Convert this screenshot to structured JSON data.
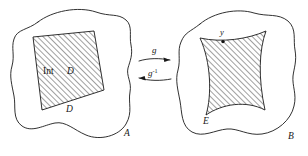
{
  "figure": {
    "background_color": "#ffffff",
    "ink_color": "#1a1a1a",
    "width": 308,
    "height": 156
  },
  "left_panel": {
    "set_label": "A",
    "region_interior_label_prefix": "Int",
    "region_interior_label_name": "D",
    "region_boundary_label": "D",
    "hatch_angle_degrees": 45,
    "region_type": "straight-sided quadrilateral"
  },
  "right_panel": {
    "set_label": "B",
    "region_label": "E",
    "point_label": "y",
    "hatch_angle_degrees": 45,
    "region_type": "curvilinear quadrilateral with concave sides"
  },
  "maps": {
    "forward": {
      "label": "g",
      "direction": "left-to-right"
    },
    "inverse": {
      "label_base": "g",
      "label_exponent": "-1",
      "label_full": "g⁻¹",
      "direction": "right-to-left"
    }
  }
}
